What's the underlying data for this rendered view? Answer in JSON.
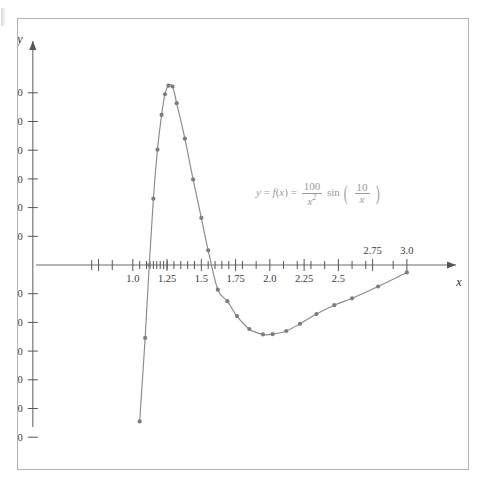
{
  "figure": {
    "annotation": {
      "lhs_y": "y",
      "equals1": "=",
      "fn": "f",
      "fn_open": "(",
      "fn_var": "x",
      "fn_close": ")",
      "equals2": "=",
      "frac1_num": "100",
      "frac1_den": "x",
      "frac1_den_exp": "2",
      "sin": "sin",
      "paren_open": "(",
      "frac2_num": "10",
      "frac2_den": "x",
      "paren_close": ")"
    }
  },
  "chart_data": {
    "type": "line",
    "title": "",
    "xlabel": "x",
    "ylabel": "y",
    "xlim": [
      0.6,
      3.3
    ],
    "ylim": [
      -68,
      68
    ],
    "grid": false,
    "legend": null,
    "curve_color": "#8a8a8a",
    "marker_color": "#7d7d7d",
    "axis_color": "#6b6b6b",
    "annotation_color": "#9a9a9a",
    "equation": "y = f(x) = (100/x^2) sin(10/x)",
    "x_tick_labels": [
      {
        "value": 1.0,
        "label": "1.0",
        "side": "below"
      },
      {
        "value": 1.25,
        "label": "1.25",
        "side": "below"
      },
      {
        "value": 1.5,
        "label": "1.5",
        "side": "below"
      },
      {
        "value": 1.75,
        "label": "1.75",
        "side": "below"
      },
      {
        "value": 2.0,
        "label": "2.0",
        "side": "below"
      },
      {
        "value": 2.25,
        "label": "2.25",
        "side": "below"
      },
      {
        "value": 2.5,
        "label": "2.5",
        "side": "below"
      },
      {
        "value": 2.75,
        "label": "2.75",
        "side": "above"
      },
      {
        "value": 3.0,
        "label": "3.0",
        "side": "above"
      }
    ],
    "x_major_ticks": [
      0.75,
      1.0,
      1.25,
      1.5,
      1.75,
      2.0,
      2.25,
      2.5,
      2.75,
      3.0
    ],
    "x_minor_ticks": [
      1.05,
      1.1,
      1.125,
      1.15,
      1.175,
      1.2,
      1.225,
      1.25,
      1.3,
      1.35,
      1.4,
      1.45,
      1.55,
      1.6,
      1.65,
      1.7,
      1.8,
      1.9,
      2.1,
      2.2,
      2.3,
      2.4,
      2.6,
      2.7,
      2.9
    ],
    "x_left_ticks": [
      0.7,
      0.85
    ],
    "y_tick_labels": [
      {
        "value": 60,
        "label": "60"
      },
      {
        "value": 50,
        "label": "50"
      },
      {
        "value": 40,
        "label": "40"
      },
      {
        "value": 30,
        "label": "30"
      },
      {
        "value": 20,
        "label": "20"
      },
      {
        "value": 10,
        "label": "10"
      },
      {
        "value": -10,
        "label": "−10"
      },
      {
        "value": -20,
        "label": "−20"
      },
      {
        "value": -30,
        "label": "−30"
      },
      {
        "value": -40,
        "label": "−40"
      },
      {
        "value": -50,
        "label": "−50"
      },
      {
        "value": -60,
        "label": "−60"
      }
    ],
    "points": [
      {
        "x": 1.05,
        "y": -54.5
      },
      {
        "x": 1.09,
        "y": -25.4
      },
      {
        "x": 1.12,
        "y": 0.0
      },
      {
        "x": 1.15,
        "y": 23.1
      },
      {
        "x": 1.18,
        "y": 40.2
      },
      {
        "x": 1.21,
        "y": 52.3
      },
      {
        "x": 1.235,
        "y": 59.5
      },
      {
        "x": 1.26,
        "y": 62.5
      },
      {
        "x": 1.29,
        "y": 62.2
      },
      {
        "x": 1.32,
        "y": 56.4
      },
      {
        "x": 1.38,
        "y": 44.0
      },
      {
        "x": 1.44,
        "y": 29.8
      },
      {
        "x": 1.5,
        "y": 16.4
      },
      {
        "x": 1.55,
        "y": 5.1
      },
      {
        "x": 1.62,
        "y": -8.6
      },
      {
        "x": 1.69,
        "y": -12.6
      },
      {
        "x": 1.76,
        "y": -17.8
      },
      {
        "x": 1.85,
        "y": -22.3
      },
      {
        "x": 1.95,
        "y": -24.2
      },
      {
        "x": 2.02,
        "y": -24.1
      },
      {
        "x": 2.12,
        "y": -23.0
      },
      {
        "x": 2.22,
        "y": -20.5
      },
      {
        "x": 2.34,
        "y": -17.1
      },
      {
        "x": 2.47,
        "y": -14.0
      },
      {
        "x": 2.6,
        "y": -11.6
      },
      {
        "x": 2.79,
        "y": -7.5
      },
      {
        "x": 3.0,
        "y": -2.6
      }
    ]
  }
}
